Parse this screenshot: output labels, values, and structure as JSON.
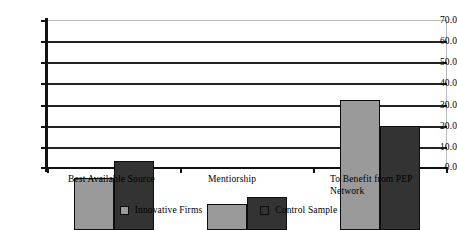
{
  "chart_data": {
    "type": "bar",
    "title": "",
    "xlabel": "",
    "ylabel": "",
    "categories": [
      "Best Available Source",
      "Mentiorship",
      "To Benefit from PEP Network"
    ],
    "series": [
      {
        "name": "Innovative Firms",
        "color": "#9a9a9a",
        "values": [
          24.5,
          12.5,
          61.5
        ]
      },
      {
        "name": "Control Sample",
        "color": "#333333",
        "values": [
          32.8,
          15.5,
          49.3
        ]
      }
    ],
    "ylim": [
      0,
      70
    ],
    "yticks": [
      "0.0",
      "10.0",
      "20.0",
      "30.0",
      "40.0",
      "50.0",
      "60.0",
      "70.0"
    ],
    "ytick_values": [
      0,
      10,
      20,
      30,
      40,
      50,
      60,
      70
    ],
    "grid": true,
    "legend_position": "bottom"
  },
  "axis": {
    "y_labels": [
      "70.0",
      "60.0",
      "50.0",
      "40.0",
      "30.0",
      "20.0",
      "10.0",
      "0.0"
    ]
  },
  "categories": {
    "0": {
      "line1": "Best Available Source",
      "line2": ""
    },
    "1": {
      "line1": "Mentiorship",
      "line2": ""
    },
    "2": {
      "line1": "To Benefit from PEP",
      "line2": "Network"
    }
  },
  "legend": {
    "items": [
      {
        "label": "Innovative Firms",
        "color": "#9a9a9a"
      },
      {
        "label": "Control Sample",
        "color": "#333333"
      }
    ]
  }
}
